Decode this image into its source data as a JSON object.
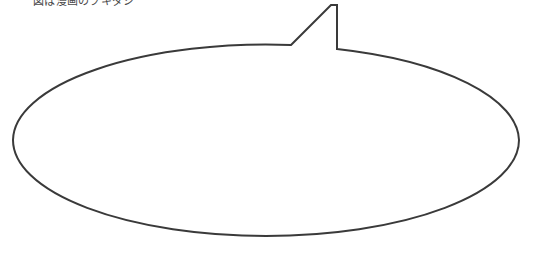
{
  "canvas": {
    "width": 534,
    "height": 255,
    "background_color": "#ffffff"
  },
  "caption": {
    "text": "図は漫画のフキダシ",
    "color": "#4a4a4a",
    "clipped_at_top": true
  },
  "drawing": {
    "name": "speech-balloon-outline",
    "stroke_color": "#3a3a3a",
    "fill_color": "#ffffff",
    "stroke_width": 2,
    "bubble": {
      "shape": "ellipse",
      "center_x": 266,
      "center_y": 140,
      "radius_x": 253,
      "radius_y": 96,
      "left": 13,
      "right": 519,
      "top": 44,
      "bottom": 236
    },
    "tail": {
      "shape": "polyline-spike",
      "apex_x": 331,
      "apex_y": 5,
      "left_base_x": 291,
      "left_base_y": 45,
      "right_base_x": 337,
      "right_base_y": 49
    }
  }
}
